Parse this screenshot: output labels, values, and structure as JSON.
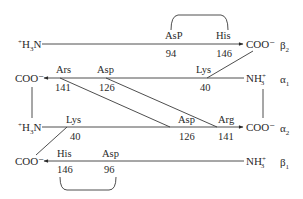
{
  "diagram": {
    "type": "hemoglobin-subunit-salt-bridges",
    "chains": [
      {
        "name": "β2",
        "left_terminus": "+H3N",
        "right_terminus": "COO-",
        "direction": "right",
        "residues": [
          {
            "name": "AsP",
            "number": "94"
          },
          {
            "name": "His",
            "number": "146"
          }
        ]
      },
      {
        "name": "α1",
        "left_terminus": "COO-",
        "right_terminus": "NH3+",
        "direction": "left",
        "residues": [
          {
            "name": "Ars",
            "number": "141"
          },
          {
            "name": "Asp",
            "number": "126"
          },
          {
            "name": "Lys",
            "number": "40"
          }
        ]
      },
      {
        "name": "α2",
        "left_terminus": "+H3N",
        "right_terminus": "COO-",
        "direction": "right",
        "residues": [
          {
            "name": "Lys",
            "number": "40"
          },
          {
            "name": "Asp",
            "number": "126"
          },
          {
            "name": "Arg",
            "number": "141"
          }
        ]
      },
      {
        "name": "β1",
        "left_terminus": "COO-",
        "right_terminus": "NH3+",
        "direction": "left",
        "residues": [
          {
            "name": "His",
            "number": "146"
          },
          {
            "name": "Asp",
            "number": "96"
          }
        ]
      }
    ],
    "labels": {
      "b2_left": "+H3N",
      "b2_right": "COO⁻",
      "b2_chain": "β2",
      "b2_r1": "AsP",
      "b2_n1": "94",
      "b2_r2": "His",
      "b2_n2": "146",
      "a1_left": "COO⁻",
      "a1_right": "NH3+",
      "a1_chain": "α1",
      "a1_r1": "Ars",
      "a1_n1": "141",
      "a1_r2": "Asp",
      "a1_n2": "126",
      "a1_r3": "Lys",
      "a1_n3": "40",
      "a2_left": "+H3N",
      "a2_right": "COO⁻",
      "a2_chain": "α2",
      "a2_r1": "Lys",
      "a2_n1": "40",
      "a2_r2": "Asp",
      "a2_n2": "126",
      "a2_r3": "Arg",
      "a2_n3": "141",
      "b1_left": "COO⁻",
      "b1_right": "NH3+",
      "b1_chain": "β1",
      "b1_r1": "His",
      "b1_n1": "146",
      "b1_r2": "Asp",
      "b1_n2": "96"
    },
    "connections": [
      {
        "from": "α1 Ars 141",
        "to": "α2 Asp 126",
        "kind": "salt-bridge"
      },
      {
        "from": "α1 Asp 126",
        "to": "α2 Arg 141",
        "kind": "salt-bridge"
      },
      {
        "from": "α1 Lys 40",
        "to": "β2 COO⁻",
        "kind": "salt-bridge"
      },
      {
        "from": "α2 Lys 40",
        "to": "β1 COO⁻",
        "kind": "salt-bridge"
      },
      {
        "from": "β2 AsP 94",
        "to": "β2 His 146",
        "kind": "intrachain-bracket"
      },
      {
        "from": "β1 His 146",
        "to": "β1 Asp 96",
        "kind": "intrachain-bracket"
      },
      {
        "from": "α1 COO⁻",
        "to": "α2 +H3N",
        "kind": "vertical-link"
      },
      {
        "from": "α1 NH3+",
        "to": "α2 COO⁻",
        "kind": "vertical-link"
      }
    ]
  }
}
